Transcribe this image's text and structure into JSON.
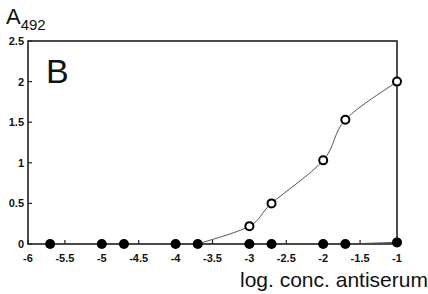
{
  "chart_data": {
    "type": "line",
    "panel_label": "B",
    "title": "",
    "xlabel": "log. conc. antiserum",
    "ylabel": "A492",
    "ylabel_main": "A",
    "ylabel_sub": "492",
    "xlim": [
      -6,
      -1
    ],
    "ylim": [
      0,
      2.5
    ],
    "x_ticks": [
      -6,
      -5.5,
      -5,
      -4.5,
      -4,
      -3.5,
      -3,
      -2.5,
      -2,
      -1.5,
      -1
    ],
    "x_tick_labels": [
      "-6",
      "-5.5",
      "-5",
      "-4.5",
      "-4",
      "-3.5",
      "-3",
      "-2.5",
      "-2",
      "-1.5",
      "-1"
    ],
    "y_ticks": [
      0,
      0.5,
      1,
      1.5,
      2,
      2.5
    ],
    "y_tick_labels": [
      "0",
      "0.5",
      "1",
      "1.5",
      "2",
      "2.5"
    ],
    "grid": false,
    "legend": null,
    "series": [
      {
        "name": "open circles",
        "marker": "open-circle",
        "x": [
          -3.7,
          -3.0,
          -2.7,
          -2.0,
          -1.7,
          -1.0
        ],
        "values": [
          0.0,
          0.22,
          0.5,
          1.03,
          1.53,
          2.0
        ],
        "fitted_curve": true
      },
      {
        "name": "filled circles",
        "marker": "filled-circle",
        "x": [
          -5.7,
          -5.0,
          -4.7,
          -4.0,
          -3.7,
          -3.0,
          -2.7,
          -2.0,
          -1.7,
          -1.0
        ],
        "values": [
          0,
          0,
          0,
          0,
          0,
          0,
          0,
          0,
          0,
          0.02
        ],
        "fitted_curve": true
      }
    ]
  }
}
